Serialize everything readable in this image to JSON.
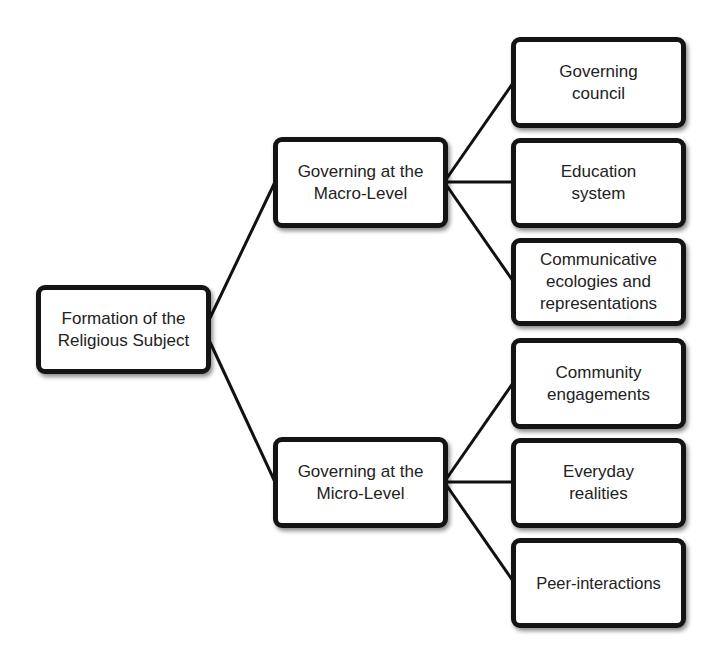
{
  "diagram": {
    "type": "tree",
    "root": {
      "label": "Formation of the\nReligious Subject"
    },
    "branches": [
      {
        "label": "Governing at the\nMacro-Level",
        "children": [
          {
            "label": "Governing\ncouncil"
          },
          {
            "label": "Education\nsystem"
          },
          {
            "label": "Communicative\necologies and\nrepresentations"
          }
        ]
      },
      {
        "label": "Governing at the\nMicro-Level",
        "children": [
          {
            "label": "Community\nengagements"
          },
          {
            "label": "Everyday\nrealities"
          },
          {
            "label": "Peer-interactions"
          }
        ]
      }
    ],
    "colors": {
      "border": "#141414",
      "background": "#ffffff",
      "text": "#222222",
      "connector": "#111111"
    }
  }
}
